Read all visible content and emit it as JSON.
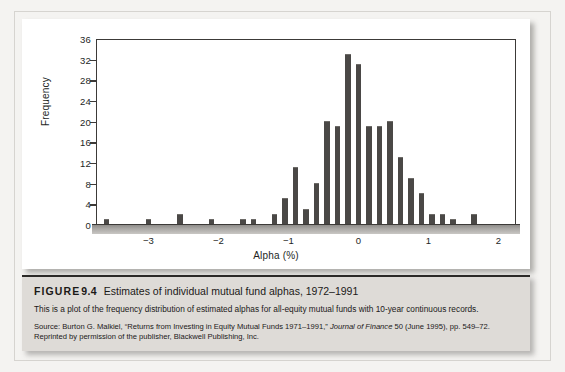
{
  "figure": {
    "label": "FIGURE",
    "number": "9.4",
    "title": "Estimates of individual mutual fund alphas, 1972–1991",
    "description": "This is a plot of the frequency distribution of estimated alphas for all-equity mutual funds with 10-year continuous records.",
    "source_prefix": "Source: Burton G. Malkiel, “Returns from Investing in Equity Mutual Funds 1971–1991,” ",
    "source_italic": "Journal of Finance",
    "source_suffix": " 50 (June 1995), pp. 549–72. Reprinted by permission of the publisher, Blackwell Publishing, Inc."
  },
  "colors": {
    "bar": "#4a4846",
    "axis": "#3c3a38",
    "caption_background": "#dedbd7",
    "page_background": "#f4f3f1",
    "chart_background": "#ffffff"
  },
  "chart_data": {
    "type": "bar",
    "title": "",
    "xlabel": "Alpha (%)",
    "ylabel": "Frequency",
    "xlim": [
      -3.75,
      2.25
    ],
    "ylim": [
      0,
      36
    ],
    "ytick_values": [
      0,
      4,
      8,
      12,
      16,
      20,
      24,
      28,
      32,
      36
    ],
    "ytick_labels": [
      "0",
      "4",
      "8",
      "12",
      "16",
      "20",
      "24",
      "28",
      "32",
      "36"
    ],
    "xtick_values": [
      -3,
      -2,
      -1,
      0,
      1,
      2
    ],
    "xtick_labels": [
      "−3",
      "−2",
      "−1",
      "0",
      "1",
      "2"
    ],
    "grid": false,
    "legend": null,
    "bin_width": 0.15,
    "categories": [
      -3.6,
      -3.45,
      -3.3,
      -3.15,
      -3.0,
      -2.85,
      -2.7,
      -2.55,
      -2.4,
      -2.25,
      -2.1,
      -1.95,
      -1.8,
      -1.65,
      -1.5,
      -1.35,
      -1.2,
      -1.05,
      -0.9,
      -0.75,
      -0.6,
      -0.45,
      -0.3,
      -0.15,
      0.0,
      0.15,
      0.3,
      0.45,
      0.6,
      0.75,
      0.9,
      1.05,
      1.2,
      1.35,
      1.5,
      1.65,
      1.8,
      1.95
    ],
    "values": [
      1,
      0,
      0,
      0,
      1,
      0,
      0,
      2,
      0,
      0,
      1,
      0,
      0,
      1,
      1,
      0,
      2,
      5,
      11,
      3,
      8,
      20,
      19,
      33,
      31,
      19,
      19,
      20,
      13,
      9,
      6,
      2,
      2,
      1,
      0,
      2,
      0,
      0
    ]
  }
}
